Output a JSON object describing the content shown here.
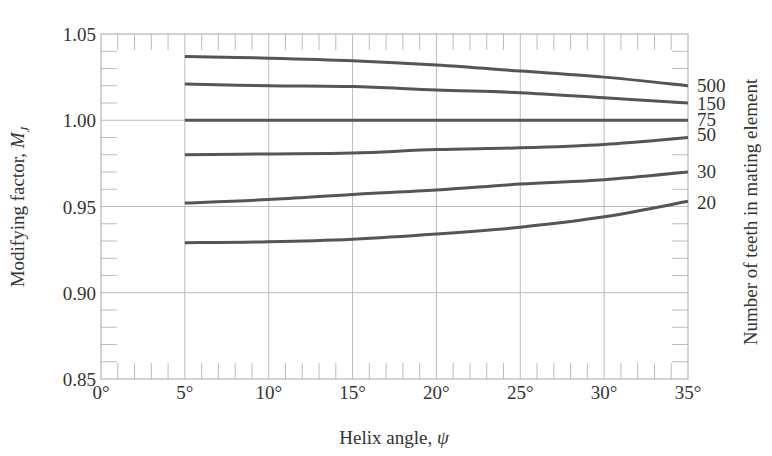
{
  "chart_data": {
    "type": "line",
    "title": "",
    "xlabel": "Helix angle, ψ",
    "ylabel": "Modifying factor, ",
    "ylabel_symbol": "M",
    "ylabel_subscript": "J",
    "right_label": "Number of teeth in mating element",
    "xlim": [
      0,
      35
    ],
    "ylim": [
      0.85,
      1.05
    ],
    "x_ticks": [
      0,
      5,
      10,
      15,
      20,
      25,
      30,
      35
    ],
    "x_tick_labels": [
      "0°",
      "5°",
      "10°",
      "15°",
      "20°",
      "25°",
      "30°",
      "35°"
    ],
    "y_ticks": [
      0.85,
      0.9,
      0.95,
      1.0,
      1.05
    ],
    "y_tick_labels": [
      "0.85",
      "0.90",
      "0.95",
      "1.00",
      "1.05"
    ],
    "grid": true,
    "legend_position": "right (inline labels at curve ends)",
    "x": [
      5,
      10,
      15,
      20,
      25,
      30,
      35
    ],
    "series": [
      {
        "name": "500",
        "values": [
          1.037,
          1.036,
          1.0345,
          1.032,
          1.0285,
          1.025,
          1.02
        ]
      },
      {
        "name": "150",
        "values": [
          1.021,
          1.02,
          1.0195,
          1.0175,
          1.016,
          1.013,
          1.01
        ]
      },
      {
        "name": "75",
        "values": [
          1.0,
          1.0,
          1.0,
          1.0,
          1.0,
          1.0,
          1.0
        ]
      },
      {
        "name": "50",
        "values": [
          0.98,
          0.9805,
          0.981,
          0.983,
          0.984,
          0.986,
          0.99
        ]
      },
      {
        "name": "30",
        "values": [
          0.952,
          0.954,
          0.957,
          0.9595,
          0.963,
          0.9655,
          0.97
        ]
      },
      {
        "name": "20",
        "values": [
          0.929,
          0.9295,
          0.931,
          0.934,
          0.938,
          0.944,
          0.953
        ]
      }
    ]
  },
  "colors": {
    "curve": "#555555",
    "grid": "#bdbdbd",
    "frame": "#a8a8a8",
    "text": "#333333"
  }
}
